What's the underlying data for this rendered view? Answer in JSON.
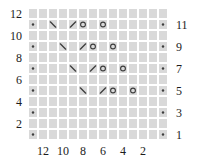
{
  "chart_data": {
    "type": "knitting-lace-chart",
    "title": "",
    "grid": {
      "rows": 12,
      "cols": 14,
      "row_numbers_top_to_bottom": [
        12,
        11,
        10,
        9,
        8,
        7,
        6,
        5,
        4,
        3,
        2,
        1
      ],
      "col_numbers_left_to_right": [
        13,
        12,
        11,
        10,
        9,
        8,
        7,
        6,
        5,
        4,
        3,
        2,
        1,
        0
      ],
      "note": "columns 13 and 0 are unnumbered edge-stitch columns; dots mark odd (right-side) rows at both edges"
    },
    "axes": {
      "left_labels": [
        {
          "text": "12",
          "row": 12
        },
        {
          "text": "10",
          "row": 10
        },
        {
          "text": "8",
          "row": 8
        },
        {
          "text": "6",
          "row": 6
        },
        {
          "text": "4",
          "row": 4
        },
        {
          "text": "2",
          "row": 2
        }
      ],
      "right_labels": [
        {
          "text": "11",
          "row": 11
        },
        {
          "text": "9",
          "row": 9
        },
        {
          "text": "7",
          "row": 7
        },
        {
          "text": "5",
          "row": 5
        },
        {
          "text": "3",
          "row": 3
        },
        {
          "text": "1",
          "row": 1
        }
      ],
      "bottom_labels": [
        {
          "text": "12",
          "col": 12
        },
        {
          "text": "10",
          "col": 10
        },
        {
          "text": "8",
          "col": 8
        },
        {
          "text": "6",
          "col": 6
        },
        {
          "text": "4",
          "col": 4
        },
        {
          "text": "2",
          "col": 2
        }
      ]
    },
    "symbol_legend": {
      "dot": "edge/purl stitch",
      "backslash": "left-leaning decrease",
      "slash": "right-leaning decrease",
      "circle": "yarn over"
    },
    "cells": [
      {
        "row": 11,
        "col": 13,
        "symbol": "dot"
      },
      {
        "row": 11,
        "col": 11,
        "symbol": "backslash"
      },
      {
        "row": 11,
        "col": 9,
        "symbol": "slash"
      },
      {
        "row": 11,
        "col": 8,
        "symbol": "circle"
      },
      {
        "row": 11,
        "col": 6,
        "symbol": "circle"
      },
      {
        "row": 11,
        "col": 0,
        "symbol": "dot"
      },
      {
        "row": 9,
        "col": 13,
        "symbol": "dot"
      },
      {
        "row": 9,
        "col": 10,
        "symbol": "backslash"
      },
      {
        "row": 9,
        "col": 8,
        "symbol": "slash"
      },
      {
        "row": 9,
        "col": 7,
        "symbol": "circle"
      },
      {
        "row": 9,
        "col": 5,
        "symbol": "circle"
      },
      {
        "row": 9,
        "col": 0,
        "symbol": "dot"
      },
      {
        "row": 7,
        "col": 13,
        "symbol": "dot"
      },
      {
        "row": 7,
        "col": 9,
        "symbol": "backslash"
      },
      {
        "row": 7,
        "col": 7,
        "symbol": "slash"
      },
      {
        "row": 7,
        "col": 6,
        "symbol": "circle"
      },
      {
        "row": 7,
        "col": 4,
        "symbol": "circle"
      },
      {
        "row": 7,
        "col": 0,
        "symbol": "dot"
      },
      {
        "row": 5,
        "col": 13,
        "symbol": "dot"
      },
      {
        "row": 5,
        "col": 8,
        "symbol": "backslash"
      },
      {
        "row": 5,
        "col": 6,
        "symbol": "slash"
      },
      {
        "row": 5,
        "col": 5,
        "symbol": "circle"
      },
      {
        "row": 5,
        "col": 3,
        "symbol": "circle"
      },
      {
        "row": 5,
        "col": 0,
        "symbol": "dot"
      },
      {
        "row": 3,
        "col": 13,
        "symbol": "dot"
      },
      {
        "row": 3,
        "col": 0,
        "symbol": "dot"
      },
      {
        "row": 1,
        "col": 13,
        "symbol": "dot"
      },
      {
        "row": 1,
        "col": 0,
        "symbol": "dot"
      }
    ],
    "colors": {
      "cell_fill": "#d9d9d9",
      "gridline": "#ffffff",
      "symbol": "#3d3d3d",
      "label_text": "#1c1c1c",
      "background": "#ffffff"
    },
    "layout": {
      "grid_left": 28,
      "grid_top": 8,
      "cell_width": 10,
      "cell_height": 11,
      "left_label_right_edge": 22,
      "right_label_left_edge": 176,
      "bottom_label_center_y": 151
    }
  }
}
